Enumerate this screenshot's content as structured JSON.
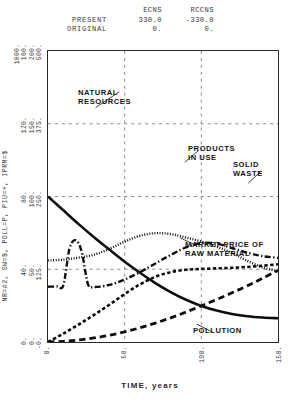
{
  "header": {
    "columns": [
      "ECNS",
      "RCCNS"
    ],
    "rows": [
      {
        "label": "PRESENT",
        "values": [
          "330.0",
          "-330.0"
        ]
      },
      {
        "label": "ORIGINAL",
        "values": [
          "0.",
          "0."
        ]
      }
    ]
  },
  "chart_data": {
    "type": "line",
    "title": "",
    "xlabel": "TIME, years",
    "ylabel": "NR=#2, SW=$, POLL=P, PIU=+, IPRM=$",
    "xlim": [
      0,
      150
    ],
    "xticks": [
      "0.",
      "50.",
      "100.",
      "150."
    ],
    "ylim": [
      0,
      2000
    ],
    "grid": true,
    "legend_position": "inline-annotations",
    "ytick_groups": [
      {
        "labels": [
          "500.",
          "200.",
          "160.",
          "1000."
        ],
        "pos": 1.0
      },
      {
        "labels": [
          "375.",
          "150.",
          "120."
        ],
        "pos": 0.75
      },
      {
        "labels": [
          "250.",
          "100.",
          "80."
        ],
        "pos": 0.5
      },
      {
        "labels": [
          "125.",
          "50.",
          "40."
        ],
        "pos": 0.25
      },
      {
        "labels": [
          "-0.",
          "0.",
          "0."
        ],
        "pos": 0.0
      }
    ],
    "series": [
      {
        "name": "NATURAL RESOURCES",
        "symbol": "#2",
        "style": "solid",
        "x": [
          0,
          10,
          20,
          30,
          40,
          50,
          60,
          70,
          80,
          90,
          100,
          110,
          120,
          130,
          140,
          150
        ],
        "y": [
          1000,
          905,
          810,
          720,
          635,
          552,
          476,
          405,
          343,
          290,
          248,
          216,
          193,
          177,
          168,
          163
        ]
      },
      {
        "name": "PRODUCTS IN USE",
        "symbol": "+",
        "style": "dotted",
        "x": [
          0,
          10,
          20,
          30,
          40,
          50,
          60,
          70,
          80,
          90,
          100,
          110,
          120,
          130,
          140,
          150
        ],
        "y": [
          560,
          566,
          580,
          600,
          640,
          690,
          730,
          748,
          742,
          718,
          690,
          655,
          612,
          558,
          512,
          487
        ]
      },
      {
        "name": "SOLID WASTE",
        "symbol": "$",
        "style": "dash-dot",
        "x": [
          0,
          6,
          10,
          14,
          18,
          22,
          26,
          30,
          40,
          50,
          60,
          70,
          80,
          90,
          100,
          110,
          120,
          130,
          140,
          150
        ],
        "y": [
          380,
          382,
          390,
          640,
          700,
          620,
          400,
          378,
          392,
          430,
          480,
          540,
          598,
          650,
          680,
          676,
          646,
          614,
          590,
          578
        ]
      },
      {
        "name": "MARKET PRICE OF RAW MATERIAL",
        "symbol": "$",
        "style": "dashed-heavy",
        "x": [
          0,
          10,
          20,
          30,
          40,
          50,
          60,
          70,
          80,
          90,
          100,
          110,
          120,
          130,
          140,
          150
        ],
        "y": [
          0,
          58,
          120,
          186,
          256,
          330,
          396,
          448,
          480,
          496,
          502,
          506,
          510,
          516,
          524,
          534
        ]
      },
      {
        "name": "POLLUTION",
        "symbol": "P",
        "style": "dashed",
        "x": [
          0,
          10,
          20,
          30,
          40,
          50,
          60,
          70,
          80,
          90,
          100,
          110,
          120,
          130,
          140,
          150
        ],
        "y": [
          0,
          5,
          14,
          28,
          46,
          70,
          98,
          130,
          166,
          206,
          248,
          292,
          338,
          386,
          438,
          492
        ]
      }
    ],
    "annotations": [
      {
        "text": "NATURAL\nRESOURCES",
        "x": 78,
        "y": 88
      },
      {
        "text": "PRODUCTS\nIN USE",
        "x": 188,
        "y": 144
      },
      {
        "text": "SOLID\nWASTE",
        "x": 233,
        "y": 160
      },
      {
        "text": "MARKET PRICE OF\nRAW MATERIAL",
        "x": 185,
        "y": 240
      },
      {
        "text": "POLLUTION",
        "x": 193,
        "y": 326
      }
    ]
  }
}
